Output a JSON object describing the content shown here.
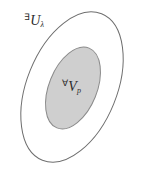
{
  "diagram": {
    "type": "nested-ellipses",
    "title": "",
    "background_color": "#ffffff",
    "outer_set": {
      "name": "outer-ellipse",
      "label_quantifier": "∃",
      "label_symbol": "U",
      "label_subscript": "λ",
      "fill_color": "none",
      "stroke_color": "#6e6e6e",
      "stroke_width": 1,
      "center_x": 72,
      "center_y": 87,
      "radius_x": 45,
      "radius_y": 79,
      "rotation_deg": 22
    },
    "inner_set": {
      "name": "inner-ellipse",
      "label_quantifier": "∀",
      "label_symbol": "V",
      "label_subscript": "p",
      "fill_color": "#cfcfcf",
      "stroke_color": "#8a8a8a",
      "stroke_width": 1,
      "center_x": 73,
      "center_y": 88,
      "radius_x": 24,
      "radius_y": 43,
      "rotation_deg": 22
    }
  }
}
